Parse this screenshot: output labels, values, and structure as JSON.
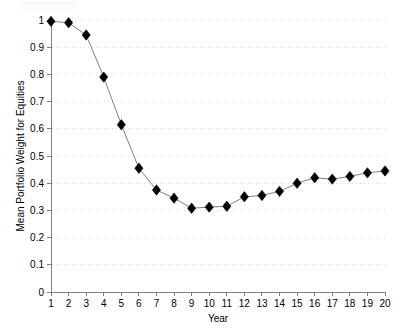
{
  "chart_data": {
    "type": "line",
    "title": "",
    "xlabel": "Year",
    "ylabel": "Mean Portfolio Weight for Equities",
    "x": [
      1,
      2,
      3,
      4,
      5,
      6,
      7,
      8,
      9,
      10,
      11,
      12,
      13,
      14,
      15,
      16,
      17,
      18,
      19,
      20
    ],
    "values": [
      0.995,
      0.99,
      0.945,
      0.79,
      0.615,
      0.455,
      0.375,
      0.345,
      0.308,
      0.312,
      0.315,
      0.35,
      0.355,
      0.37,
      0.4,
      0.42,
      0.415,
      0.425,
      0.438,
      0.445
    ],
    "series": [
      {
        "name": "Mean Portfolio Weight for Equities",
        "values": [
          0.995,
          0.99,
          0.945,
          0.79,
          0.615,
          0.455,
          0.375,
          0.345,
          0.308,
          0.312,
          0.315,
          0.35,
          0.355,
          0.37,
          0.4,
          0.42,
          0.415,
          0.425,
          0.438,
          0.445
        ]
      }
    ],
    "xlim": [
      1,
      20
    ],
    "ylim": [
      0,
      1
    ],
    "xticks": [
      "1",
      "2",
      "3",
      "4",
      "5",
      "6",
      "7",
      "8",
      "9",
      "10",
      "11",
      "12",
      "13",
      "14",
      "15",
      "16",
      "17",
      "18",
      "19",
      "20"
    ],
    "yticks": [
      "0",
      "0.1",
      "0.2",
      "0.3",
      "0.4",
      "0.5",
      "0.6",
      "0.7",
      "0.8",
      "0.9",
      "1"
    ],
    "ytick_values": [
      0,
      0.1,
      0.2,
      0.3,
      0.4,
      0.5,
      0.6,
      0.7,
      0.8,
      0.9,
      1
    ],
    "grid": "horizontal-dotted",
    "legend": "none",
    "marker": "diamond",
    "marker_color": "#000000",
    "line_color": "#808080",
    "grid_color": "#d9d9d9",
    "axis_color": "#808080",
    "background_color": "#ffffff"
  }
}
